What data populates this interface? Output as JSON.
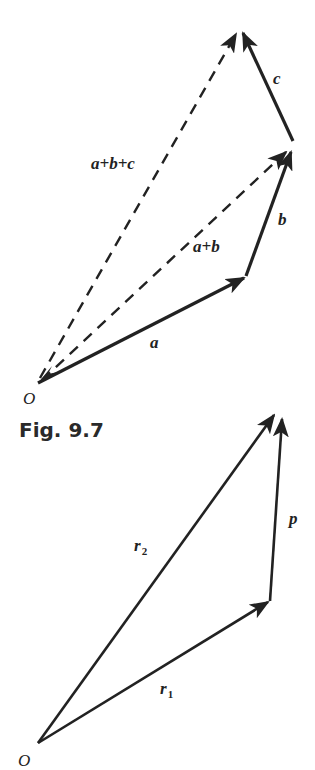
{
  "figure_top": {
    "caption": "Fig. 9.7",
    "origin_label": "O",
    "vectors": [
      {
        "name": "a",
        "label": "a",
        "style": "solid",
        "from": [
          38,
          383
        ],
        "to": [
          246,
          277
        ]
      },
      {
        "name": "b",
        "label": "b",
        "style": "solid",
        "from": [
          246,
          277
        ],
        "to": [
          292,
          149
        ]
      },
      {
        "name": "c",
        "label": "c",
        "style": "solid",
        "from": [
          293,
          141
        ],
        "to": [
          241,
          30
        ]
      },
      {
        "name": "a+b",
        "label": "a+b",
        "style": "dashed",
        "from": [
          40,
          380
        ],
        "to": [
          288,
          150
        ]
      },
      {
        "name": "a+b+c",
        "label": "a+b+c",
        "style": "dashed",
        "from": [
          40,
          378
        ],
        "to": [
          238,
          31
        ]
      }
    ]
  },
  "figure_bottom": {
    "origin_label": "O",
    "vectors": [
      {
        "name": "r1",
        "label": "r",
        "subscript": "1",
        "style": "solid",
        "from": [
          38,
          743
        ],
        "to": [
          270,
          601
        ]
      },
      {
        "name": "p",
        "label": "p",
        "style": "solid",
        "from": [
          270,
          601
        ],
        "to": [
          282,
          416
        ]
      },
      {
        "name": "r2",
        "label": "r",
        "subscript": "2",
        "style": "solid",
        "from": [
          38,
          743
        ],
        "to": [
          276,
          412
        ]
      }
    ]
  },
  "colors": {
    "ink": "#222222",
    "background": "#ffffff"
  }
}
